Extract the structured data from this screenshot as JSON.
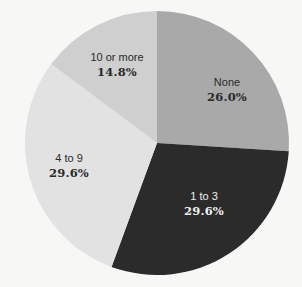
{
  "chart_data": {
    "type": "pie",
    "title": "",
    "start_angle_deg": 0,
    "direction": "clockwise",
    "center": [
      157,
      143
    ],
    "radius": 132,
    "categories": [
      "None",
      "1 to 3",
      "4 to 9",
      "10 or more"
    ],
    "values": [
      26.0,
      29.6,
      29.6,
      14.8
    ],
    "unit": "%",
    "legend": "none (labels inside slices)",
    "slices": [
      {
        "label": "None",
        "value": 26.0,
        "value_text": "26.0%",
        "color": "#a9a9a9",
        "text_color": "#2a2a2a",
        "label_pos": [
          227,
          86
        ],
        "value_pos": [
          227,
          101
        ]
      },
      {
        "label": "1 to 3",
        "value": 29.6,
        "value_text": "29.6%",
        "color": "#2b2b2b",
        "text_color": "#efefef",
        "label_pos": [
          204,
          200
        ],
        "value_pos": [
          204,
          215
        ]
      },
      {
        "label": "4 to 9",
        "value": 29.6,
        "value_text": "29.6%",
        "color": "#e2e2e2",
        "text_color": "#2a2a2a",
        "label_pos": [
          69,
          162
        ],
        "value_pos": [
          69,
          177
        ]
      },
      {
        "label": "10 or more",
        "value": 14.8,
        "value_text": "14.8%",
        "color": "#cfcfcf",
        "text_color": "#2a2a2a",
        "label_pos": [
          117,
          61
        ],
        "value_pos": [
          117,
          76
        ]
      }
    ]
  }
}
